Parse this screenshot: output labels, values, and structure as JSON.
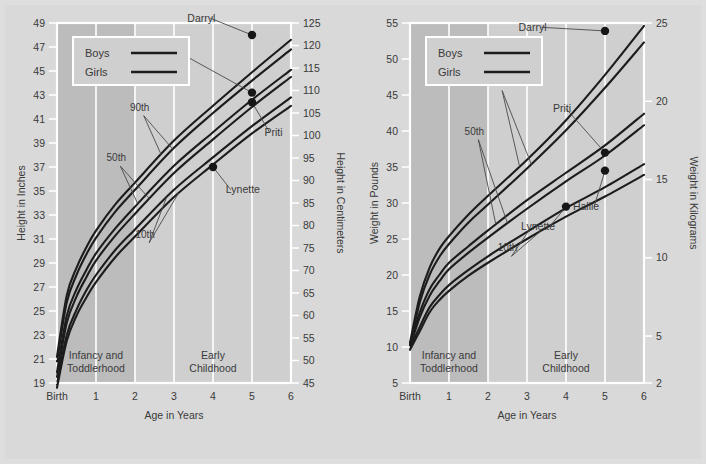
{
  "page": {
    "background_color": "#dedede",
    "panel_color": "#d9d9d9"
  },
  "chart_data": [
    {
      "type": "line",
      "title": "Height growth chart",
      "xlabel": "Age in Years",
      "ylabel": "Height in Inches",
      "ylabel_right": "Height in Centimeters",
      "xlim": [
        0,
        6
      ],
      "ylim": [
        19,
        49
      ],
      "ylim_right": [
        45,
        125
      ],
      "grid": true,
      "legend_position": "top-left",
      "x_tick_labels": [
        "Birth",
        "1",
        "2",
        "3",
        "4",
        "5",
        "6"
      ],
      "x_tick_values": [
        0,
        1,
        2,
        3,
        4,
        5,
        6
      ],
      "y_tick_labels": [
        "19",
        "21",
        "23",
        "25",
        "27",
        "29",
        "31",
        "33",
        "35",
        "37",
        "39",
        "41",
        "43",
        "45",
        "47",
        "49"
      ],
      "y_tick_values": [
        19,
        21,
        23,
        25,
        27,
        29,
        31,
        33,
        35,
        37,
        39,
        41,
        43,
        45,
        47,
        49
      ],
      "y_right_tick_labels": [
        "45",
        "50",
        "55",
        "60",
        "65",
        "70",
        "75",
        "80",
        "85",
        "90",
        "95",
        "100",
        "105",
        "110",
        "115",
        "120",
        "125"
      ],
      "y_right_tick_values": [
        45,
        50,
        55,
        60,
        65,
        70,
        75,
        80,
        85,
        90,
        95,
        100,
        105,
        110,
        115,
        120,
        125
      ],
      "bands": [
        {
          "label": "Infancy and Toddlerhood",
          "x_start": 0,
          "x_end": 2,
          "color": "#bcbcbc"
        },
        {
          "label": "Early Childhood",
          "x_start": 2,
          "x_end": 6,
          "color": "#cfcfcf"
        }
      ],
      "series": [
        {
          "name": "Boys 90th",
          "percentile": "90th",
          "sex": "Boys",
          "x": [
            0,
            0.25,
            0.5,
            0.75,
            1,
            1.5,
            2,
            3,
            4,
            5,
            6
          ],
          "values": [
            21.2,
            26.3,
            28.6,
            30.3,
            31.7,
            33.9,
            35.7,
            39.2,
            42.1,
            44.9,
            47.6
          ]
        },
        {
          "name": "Girls 90th",
          "percentile": "90th",
          "sex": "Girls",
          "x": [
            0,
            0.25,
            0.5,
            0.75,
            1,
            1.5,
            2,
            3,
            4,
            5,
            6
          ],
          "values": [
            20.8,
            25.7,
            28.0,
            29.7,
            31.1,
            33.3,
            35.1,
            38.6,
            41.5,
            44.2,
            46.8
          ]
        },
        {
          "name": "Boys 50th",
          "percentile": "50th",
          "sex": "Boys",
          "x": [
            0,
            0.25,
            0.5,
            0.75,
            1,
            1.5,
            2,
            3,
            4,
            5,
            6
          ],
          "values": [
            19.9,
            24.6,
            26.8,
            28.4,
            29.8,
            31.9,
            33.7,
            37.1,
            39.9,
            42.6,
            45.1
          ]
        },
        {
          "name": "Girls 50th",
          "percentile": "50th",
          "sex": "Girls",
          "x": [
            0,
            0.25,
            0.5,
            0.75,
            1,
            1.5,
            2,
            3,
            4,
            5,
            6
          ],
          "values": [
            19.5,
            24.0,
            26.2,
            27.8,
            29.2,
            31.3,
            33.1,
            36.5,
            39.3,
            42.0,
            44.5
          ]
        },
        {
          "name": "Boys 10th",
          "percentile": "10th",
          "sex": "Boys",
          "x": [
            0,
            0.25,
            0.5,
            0.75,
            1,
            1.5,
            2,
            3,
            4,
            5,
            6
          ],
          "values": [
            18.9,
            23.0,
            25.1,
            26.7,
            28.0,
            30.1,
            31.8,
            35.1,
            37.8,
            40.4,
            42.8
          ]
        },
        {
          "name": "Girls 10th",
          "percentile": "10th",
          "sex": "Girls",
          "x": [
            0,
            0.25,
            0.5,
            0.75,
            1,
            1.5,
            2,
            3,
            4,
            5,
            6
          ],
          "values": [
            18.6,
            22.5,
            24.6,
            26.1,
            27.4,
            29.5,
            31.2,
            34.5,
            37.2,
            39.8,
            42.1
          ]
        }
      ],
      "annotations": [
        {
          "label": "90th",
          "x": 2.12,
          "y": 41.7
        },
        {
          "label": "50th",
          "x": 1.52,
          "y": 37.5
        },
        {
          "label": "10th",
          "x": 2.26,
          "y": 31.1
        }
      ],
      "data_points": [
        {
          "name": "Darryl",
          "x": 5,
          "y": 48.0,
          "label_x": 4.06,
          "label_y": 49.4
        },
        {
          "name": "Hallie",
          "x": 5,
          "y": 43.2,
          "label_x": 3.23,
          "label_y": 46.6
        },
        {
          "name": "Priti",
          "x": 5,
          "y": 42.4,
          "label_x": 5.32,
          "label_y": 39.9
        },
        {
          "name": "Lynette",
          "x": 4,
          "y": 37.0,
          "label_x": 4.33,
          "label_y": 35.1
        }
      ],
      "legend": [
        {
          "label": "Boys"
        },
        {
          "label": "Girls"
        }
      ]
    },
    {
      "type": "line",
      "title": "Weight growth chart",
      "xlabel": "Age in Years",
      "ylabel": "Weight in Pounds",
      "ylabel_right": "Weight in Kilograms",
      "xlim": [
        0,
        6
      ],
      "ylim": [
        5,
        55
      ],
      "ylim_right": [
        2,
        25
      ],
      "grid": true,
      "legend_position": "top-left",
      "x_tick_labels": [
        "Birth",
        "1",
        "2",
        "3",
        "4",
        "5",
        "6"
      ],
      "x_tick_values": [
        0,
        1,
        2,
        3,
        4,
        5,
        6
      ],
      "y_tick_labels": [
        "5",
        "10",
        "15",
        "20",
        "25",
        "30",
        "35",
        "40",
        "45",
        "50",
        "55"
      ],
      "y_tick_values": [
        5,
        10,
        15,
        20,
        25,
        30,
        35,
        40,
        45,
        50,
        55
      ],
      "y_right_tick_labels": [
        "2",
        "5",
        "10",
        "15",
        "20",
        "25"
      ],
      "y_right_tick_values": [
        2,
        5,
        10,
        15,
        20,
        25
      ],
      "bands": [
        {
          "label": "Infancy and Toddlerhood",
          "x_start": 0,
          "x_end": 2,
          "color": "#bcbcbc"
        },
        {
          "label": "Early Childhood",
          "x_start": 2,
          "x_end": 6,
          "color": "#cfcfcf"
        }
      ],
      "series": [
        {
          "name": "Boys 90th",
          "percentile": "90th",
          "sex": "Boys",
          "x": [
            0,
            0.25,
            0.5,
            0.75,
            1,
            1.5,
            2,
            3,
            4,
            5,
            6
          ],
          "values": [
            10.6,
            17.0,
            21.0,
            23.6,
            25.4,
            28.4,
            31.0,
            36.0,
            41.5,
            47.8,
            54.6
          ]
        },
        {
          "name": "Girls 90th",
          "percentile": "90th",
          "sex": "Girls",
          "x": [
            0,
            0.25,
            0.5,
            0.75,
            1,
            1.5,
            2,
            3,
            4,
            5,
            6
          ],
          "values": [
            10.2,
            16.2,
            20.0,
            22.5,
            24.3,
            27.3,
            29.8,
            34.8,
            40.1,
            46.0,
            52.3
          ]
        },
        {
          "name": "Boys 50th",
          "percentile": "50th",
          "sex": "Boys",
          "x": [
            0,
            0.25,
            0.5,
            0.75,
            1,
            1.5,
            2,
            3,
            4,
            5,
            6
          ],
          "values": [
            10.4,
            14.8,
            18.0,
            20.0,
            21.7,
            24.0,
            26.2,
            30.4,
            34.2,
            38.0,
            42.4
          ]
        },
        {
          "name": "Girls 50th",
          "percentile": "50th",
          "sex": "Girls",
          "x": [
            0,
            0.25,
            0.5,
            0.75,
            1,
            1.5,
            2,
            3,
            4,
            5,
            6
          ],
          "values": [
            10.0,
            14.1,
            17.1,
            19.1,
            20.8,
            23.1,
            25.2,
            29.2,
            33.0,
            36.6,
            40.8
          ]
        },
        {
          "name": "Boys 10th",
          "percentile": "10th",
          "sex": "Boys",
          "x": [
            0,
            0.25,
            0.5,
            0.75,
            1,
            1.5,
            2,
            3,
            4,
            5,
            6
          ],
          "values": [
            9.9,
            12.8,
            15.5,
            17.2,
            18.6,
            20.7,
            22.6,
            26.0,
            29.3,
            32.2,
            35.4
          ]
        },
        {
          "name": "Girls 10th",
          "percentile": "10th",
          "sex": "Girls",
          "x": [
            0,
            0.25,
            0.5,
            0.75,
            1,
            1.5,
            2,
            3,
            4,
            5,
            6
          ],
          "values": [
            9.6,
            12.2,
            14.8,
            16.5,
            17.8,
            19.9,
            21.7,
            25.0,
            28.1,
            30.9,
            33.9
          ]
        }
      ],
      "annotations": [
        {
          "label": "90th",
          "x": 2.26,
          "y": 46.3
        },
        {
          "label": "50th",
          "x": 1.65,
          "y": 39.5
        },
        {
          "label": "10th",
          "x": 2.5,
          "y": 23.3
        }
      ],
      "data_points": [
        {
          "name": "Darryl",
          "x": 5,
          "y": 53.9,
          "label_x": 3.5,
          "label_y": 54.4
        },
        {
          "name": "Priti",
          "x": 5,
          "y": 37.0,
          "label_x": 4.13,
          "label_y": 43.1
        },
        {
          "name": "Hallie",
          "x": 5,
          "y": 34.5,
          "label_x": 4.85,
          "label_y": 29.5
        },
        {
          "name": "Lynette",
          "x": 4,
          "y": 29.5,
          "label_x": 3.72,
          "label_y": 26.8
        }
      ],
      "legend": [
        {
          "label": "Boys"
        },
        {
          "label": "Girls"
        }
      ]
    }
  ]
}
